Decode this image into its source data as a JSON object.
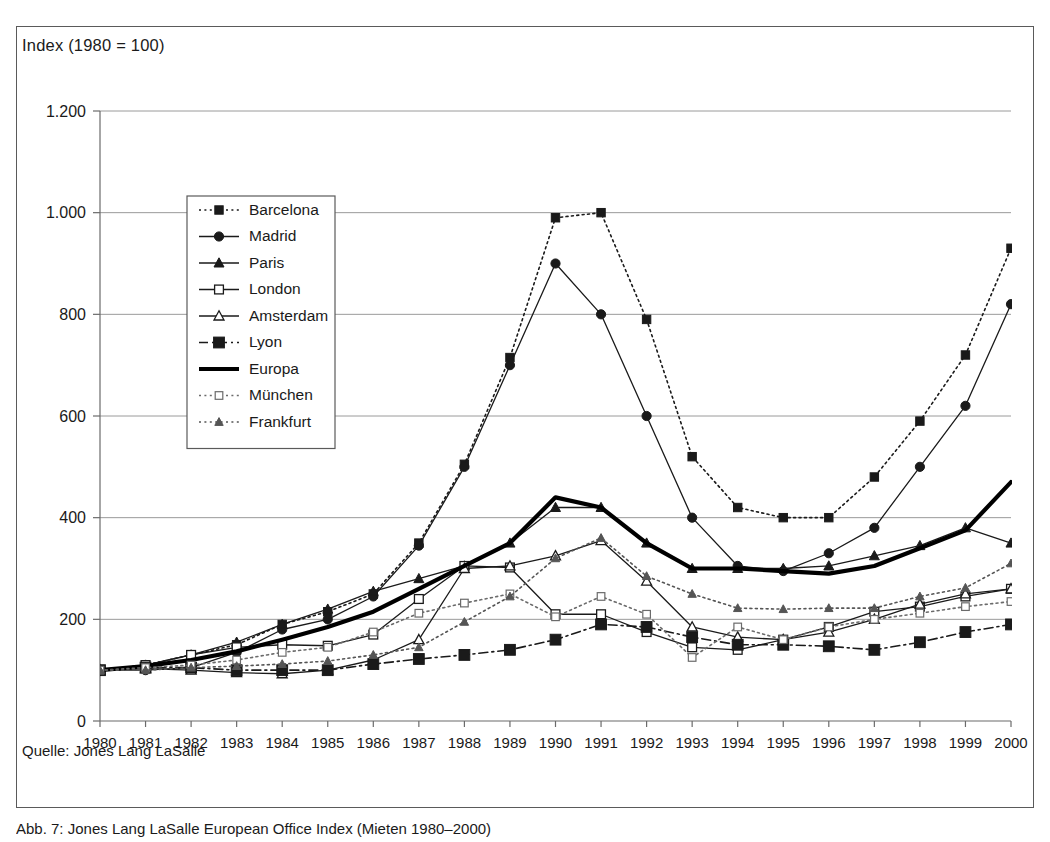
{
  "figure": {
    "axis_title": "Index (1980 = 100)",
    "source_note": "Quelle: Jones Lang LaSalle",
    "caption": "Abb. 7: Jones Lang LaSalle European Office Index (Mieten 1980–2000)"
  },
  "chart_data": {
    "type": "line",
    "title": "Index (1980 = 100)",
    "xlabel": "",
    "ylabel": "Index (1980 = 100)",
    "grid": true,
    "legend_position": "upper-left-inside",
    "xlim": [
      1980,
      2000
    ],
    "ylim": [
      0,
      1200
    ],
    "yticks": [
      0,
      200,
      400,
      600,
      800,
      1000,
      1200
    ],
    "ytick_labels": [
      "0",
      "200",
      "400",
      "600",
      "800",
      "1.000",
      "1.200"
    ],
    "x": [
      1980,
      1981,
      1982,
      1983,
      1984,
      1985,
      1986,
      1987,
      1988,
      1989,
      1990,
      1991,
      1992,
      1993,
      1994,
      1995,
      1996,
      1997,
      1998,
      1999,
      2000
    ],
    "xtick_labels": [
      "1980",
      "1981",
      "1982",
      "1983",
      "1984",
      "1985",
      "1986",
      "1987",
      "1988",
      "1989",
      "1990",
      "1991",
      "1992",
      "1993",
      "1994",
      "1995",
      "1996",
      "1997",
      "1998",
      "1999",
      "2000"
    ],
    "series": [
      {
        "name": "Barcelona",
        "marker": "square-filled",
        "linestyle": "dotted",
        "color": "#1a1a1a",
        "values": [
          100,
          110,
          130,
          150,
          190,
          215,
          250,
          350,
          505,
          715,
          990,
          1000,
          790,
          520,
          420,
          400,
          400,
          480,
          590,
          720,
          930
        ]
      },
      {
        "name": "Madrid",
        "marker": "circle-filled",
        "linestyle": "solid",
        "color": "#1a1a1a",
        "values": [
          100,
          100,
          105,
          135,
          180,
          200,
          245,
          345,
          500,
          700,
          900,
          800,
          600,
          400,
          305,
          295,
          330,
          380,
          500,
          620,
          820
        ]
      },
      {
        "name": "Paris",
        "marker": "triangle-filled",
        "linestyle": "solid",
        "color": "#1a1a1a",
        "values": [
          100,
          110,
          130,
          155,
          190,
          220,
          255,
          280,
          305,
          350,
          420,
          420,
          350,
          300,
          300,
          300,
          305,
          325,
          345,
          380,
          350
        ]
      },
      {
        "name": "London",
        "marker": "square-open",
        "linestyle": "solid",
        "color": "#1a1a1a",
        "values": [
          100,
          110,
          130,
          145,
          150,
          148,
          170,
          240,
          305,
          302,
          210,
          210,
          175,
          145,
          140,
          160,
          185,
          215,
          225,
          245,
          260
        ]
      },
      {
        "name": "Amsterdam",
        "marker": "triangle-open",
        "linestyle": "solid",
        "color": "#1a1a1a",
        "values": [
          100,
          103,
          100,
          95,
          93,
          100,
          120,
          160,
          300,
          305,
          325,
          355,
          275,
          185,
          165,
          160,
          175,
          200,
          230,
          250,
          260
        ]
      },
      {
        "name": "Lyon",
        "marker": "square-filled-large",
        "linestyle": "dashdot",
        "color": "#1a1a1a",
        "values": [
          100,
          105,
          105,
          100,
          100,
          100,
          112,
          122,
          130,
          140,
          160,
          190,
          185,
          165,
          150,
          150,
          147,
          140,
          155,
          175,
          190
        ]
      },
      {
        "name": "Europa",
        "marker": "none",
        "linestyle": "thick-solid",
        "color": "#000000",
        "values": [
          100,
          108,
          120,
          137,
          160,
          185,
          215,
          260,
          305,
          350,
          440,
          420,
          350,
          300,
          300,
          295,
          290,
          305,
          340,
          375,
          470
        ]
      },
      {
        "name": "München",
        "marker": "square-open-small",
        "linestyle": "dotted",
        "color": "#6b6b6b",
        "values": [
          100,
          105,
          110,
          120,
          135,
          145,
          175,
          212,
          232,
          250,
          205,
          245,
          210,
          125,
          185,
          160,
          185,
          200,
          212,
          225,
          235
        ]
      },
      {
        "name": "Frankfurt",
        "marker": "triangle-filled-small",
        "linestyle": "dotted",
        "color": "#555555",
        "values": [
          100,
          100,
          105,
          108,
          112,
          118,
          130,
          145,
          195,
          245,
          320,
          360,
          285,
          250,
          222,
          220,
          222,
          222,
          245,
          262,
          310
        ]
      }
    ]
  }
}
